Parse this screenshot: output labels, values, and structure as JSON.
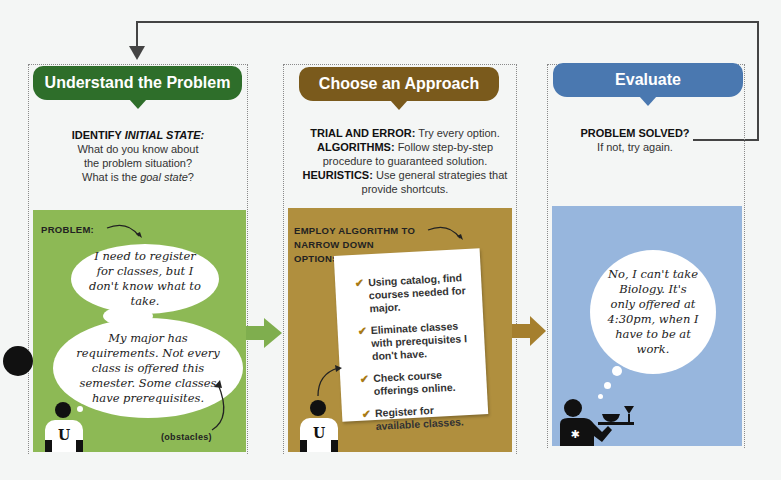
{
  "steps": [
    {
      "title": "Understand the Problem",
      "color": "#2e6e2a",
      "desc_label": "IDENTIFY ",
      "desc_label_em": "INITIAL STATE:",
      "desc_lines": [
        "What do you know about",
        "the problem situation?"
      ],
      "desc_goal_prefix": "What is the ",
      "desc_goal_em": "goal state",
      "desc_goal_suffix": "?",
      "panel_color": "#8db955",
      "panel_label": "PROBLEM:",
      "thought_1": "I need to register for classes, but I don't know what to take.",
      "thought_2": "My major has requirements. Not every class is offered this semester. Some classes have prerequisites.",
      "annotation": "(obstacles)",
      "shirt_letter": "U"
    },
    {
      "title": "Choose an Approach",
      "color": "#7a5a1c",
      "strategies": [
        {
          "term": "TRIAL AND ERROR:",
          "text": "Try every option."
        },
        {
          "term": "ALGORITHMS:",
          "text": "Follow step-by-step procedure to guaranteed solution."
        },
        {
          "term": "HEURISTICS:",
          "text": "Use general strategies that provide shortcuts."
        }
      ],
      "panel_color": "#b08f3e",
      "panel_label": "EMPLOY ALGORITHM TO NARROW DOWN OPTIONS:",
      "checklist": [
        "Using catalog, find courses needed for major.",
        "Eliminate classes with prerequisites I don't have.",
        "Check course offerings online.",
        "Register for available classes."
      ],
      "check_glyph": "✔",
      "shirt_letter": "U"
    },
    {
      "title": "Evaluate",
      "color": "#4a78b0",
      "desc_label": "PROBLEM SOLVED?",
      "desc_text": "If not, try again.",
      "panel_color": "#97b6dd",
      "thought": "No, I can't take Biology. It's only offered at 4:30pm, when I have to be at work."
    }
  ],
  "arrows": {
    "loop_back": "from Evaluate back to Understand the Problem",
    "step1_to_2_color": "#7fae4e",
    "step2_to_3_color": "#a57f2e"
  }
}
